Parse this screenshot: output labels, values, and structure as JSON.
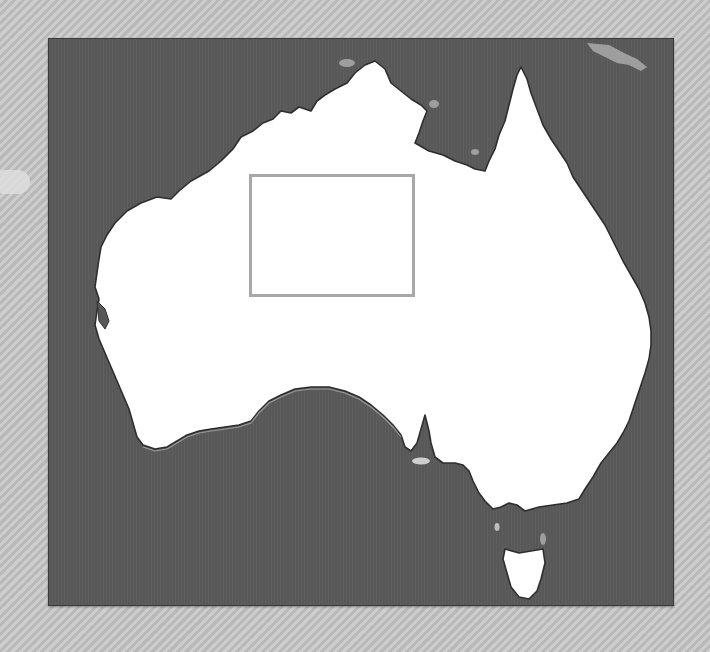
{
  "map": {
    "region": "Australia",
    "frame": {
      "left": 48,
      "top": 38,
      "width": 624,
      "height": 566
    },
    "colors": {
      "sea": "#585858",
      "land": "#ffffff",
      "coast_outline": "#2e2e2e",
      "shelf_highlight": "#9a9a9a",
      "islands_outside": "#9e9e9e",
      "selection_border": "#a8a8a8",
      "page_background": "#c4c4c4"
    },
    "selection_box": {
      "left": 248,
      "top": 173,
      "width": 166,
      "height": 123
    },
    "features": [
      "mainland-australia",
      "tasmania",
      "kangaroo-island",
      "new-guinea-coast",
      "gulf-of-carpentaria",
      "cape-york-peninsula",
      "great-australian-bight",
      "spencer-gulf"
    ]
  }
}
